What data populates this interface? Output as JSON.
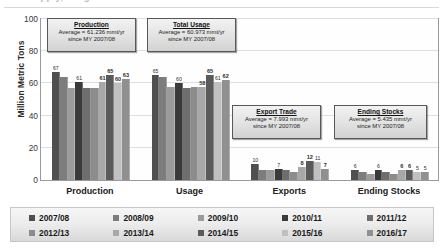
{
  "figure": {
    "cut_title": "Supply, Usage and Stocks",
    "axis": {
      "ylabel": "Million Metric Tons",
      "yticks": [
        "100",
        "80",
        "60",
        "40",
        "20",
        "0"
      ],
      "ylim": [
        0,
        100
      ]
    },
    "xcats": [
      "Production",
      "Usage",
      "Exports",
      "Ending Stocks"
    ]
  },
  "callouts": [
    {
      "name": "production",
      "title": "Production",
      "line1": "Average = 61.236 mmt/yr",
      "line2": "since MY 2007/08"
    },
    {
      "name": "total-usage",
      "title": "Total Usage",
      "line1": "Average = 60.973 mmt/yr",
      "line2": "since MY 2007/08"
    },
    {
      "name": "export-trade",
      "title": "Export Trade",
      "line1": "Average = 7.993 mmt/yr",
      "line2": "since MY 2007/08"
    },
    {
      "name": "ending-stocks",
      "title": "Ending Stocks",
      "line1": "Average = 5.435 mmt/yr",
      "line2": "since MY 2007/08"
    }
  ],
  "legend": {
    "row1": [
      "2007/08",
      "2008/09",
      "2009/10",
      "2010/11",
      "2011/12"
    ],
    "row2": [
      "2012/13",
      "2013/14",
      "2014/15",
      "2015/16",
      "2016/17"
    ]
  },
  "chart_data": {
    "type": "bar",
    "title": "Supply, Usage and Stocks",
    "xlabel": "",
    "ylabel": "Million Metric Tons",
    "ylim": [
      0,
      100
    ],
    "ytick_values": [
      0,
      20,
      40,
      60,
      80,
      100
    ],
    "grid": true,
    "legend_position": "bottom",
    "categories": [
      "Production",
      "Usage",
      "Exports",
      "Ending Stocks"
    ],
    "series": [
      {
        "name": "2007/08",
        "color": "#4f4f4f",
        "values": [
          67,
          65,
          10,
          6
        ]
      },
      {
        "name": "2008/09",
        "color": "#7d7d7d",
        "values": [
          64,
          64,
          6,
          5
        ]
      },
      {
        "name": "2009/10",
        "color": "#9b9b9b",
        "values": [
          57,
          58,
          6,
          4
        ]
      },
      {
        "name": "2010/11",
        "color": "#3a3a3a",
        "values": [
          61,
          60,
          7,
          6
        ]
      },
      {
        "name": "2011/12",
        "color": "#6e6e6e",
        "values": [
          57,
          57,
          6,
          5
        ]
      },
      {
        "name": "2012/13",
        "color": "#8c8c8c",
        "values": [
          57,
          58,
          5,
          4
        ]
      },
      {
        "name": "2013/14",
        "color": "#a8a8a8",
        "values": [
          61,
          58,
          8,
          6
        ]
      },
      {
        "name": "2014/15",
        "color": "#5a5a5a",
        "values": [
          65,
          65,
          12,
          6
        ]
      },
      {
        "name": "2015/16",
        "color": "#c0c0c0",
        "values": [
          60,
          61,
          11,
          5
        ]
      },
      {
        "name": "2016/17",
        "color": "#909090",
        "values": [
          63,
          62,
          7,
          5
        ]
      }
    ],
    "data_labels": {
      "Production": [
        "67",
        "",
        "",
        "61",
        "",
        "",
        "61",
        "65",
        "60",
        "63"
      ],
      "Usage": [
        "65",
        "",
        "",
        "60",
        "",
        "",
        "58",
        "65",
        "61",
        "62"
      ],
      "Exports": [
        "10",
        "",
        "",
        "7",
        "",
        "",
        "8",
        "12",
        "11",
        "7"
      ],
      "Ending Stocks": [
        "6",
        "",
        "",
        "6",
        "",
        "",
        "6",
        "6",
        "5",
        "5"
      ]
    },
    "bold_labels": {
      "Production": [
        false,
        false,
        false,
        false,
        false,
        false,
        true,
        true,
        true,
        true
      ],
      "Usage": [
        false,
        false,
        false,
        false,
        false,
        false,
        true,
        true,
        false,
        true
      ],
      "Exports": [
        false,
        false,
        false,
        false,
        false,
        false,
        true,
        true,
        false,
        true
      ],
      "Ending Stocks": [
        false,
        false,
        false,
        false,
        false,
        false,
        true,
        true,
        false,
        false
      ]
    }
  }
}
